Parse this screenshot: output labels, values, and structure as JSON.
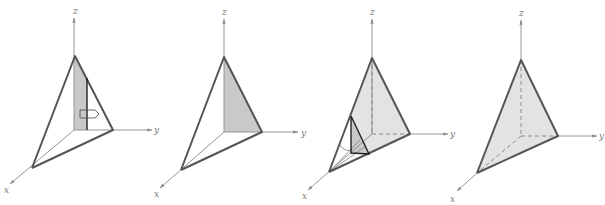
{
  "figure": {
    "colors": {
      "axis": "#8a8a8a",
      "edge": "#555555",
      "shade_dark": "#c9c9c9",
      "shade_light": "#e3e3e3",
      "label": "#777777"
    },
    "panels": [
      {
        "id": 1,
        "axis_labels": {
          "x": "x",
          "y": "y",
          "z": "z"
        },
        "feature": "vertical shaded strip with hollow arrow in y direction"
      },
      {
        "id": 2,
        "axis_labels": {
          "x": "x",
          "y": "y",
          "z": "z"
        },
        "feature": "shaded yz-face triangle"
      },
      {
        "id": 3,
        "axis_labels": {
          "x": "x",
          "y": "y",
          "z": "z"
        },
        "feature": "slab sweeping along x with small cross-section triangle"
      },
      {
        "id": 4,
        "axis_labels": {
          "x": "x",
          "y": "y",
          "z": "z"
        },
        "feature": "fully shaded tetrahedron with dashed hidden edges"
      }
    ]
  }
}
